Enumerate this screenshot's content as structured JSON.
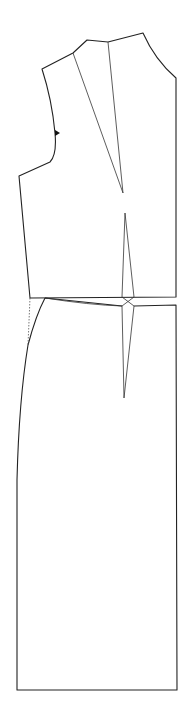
{
  "diagram": {
    "type": "sewing-pattern",
    "colors": {
      "line": "#222222",
      "background": "#ffffff"
    },
    "pieces": [
      {
        "name": "bodice-front",
        "features": [
          "neckline",
          "shoulder-seam",
          "armhole",
          "armhole-notch",
          "side-seam",
          "shoulder-dart",
          "waist-dart",
          "center-front"
        ]
      },
      {
        "name": "skirt-front",
        "features": [
          "waist-seam",
          "waist-dart",
          "side-seam-curve",
          "dotted-hip-guide",
          "hem",
          "center-front"
        ]
      }
    ]
  }
}
